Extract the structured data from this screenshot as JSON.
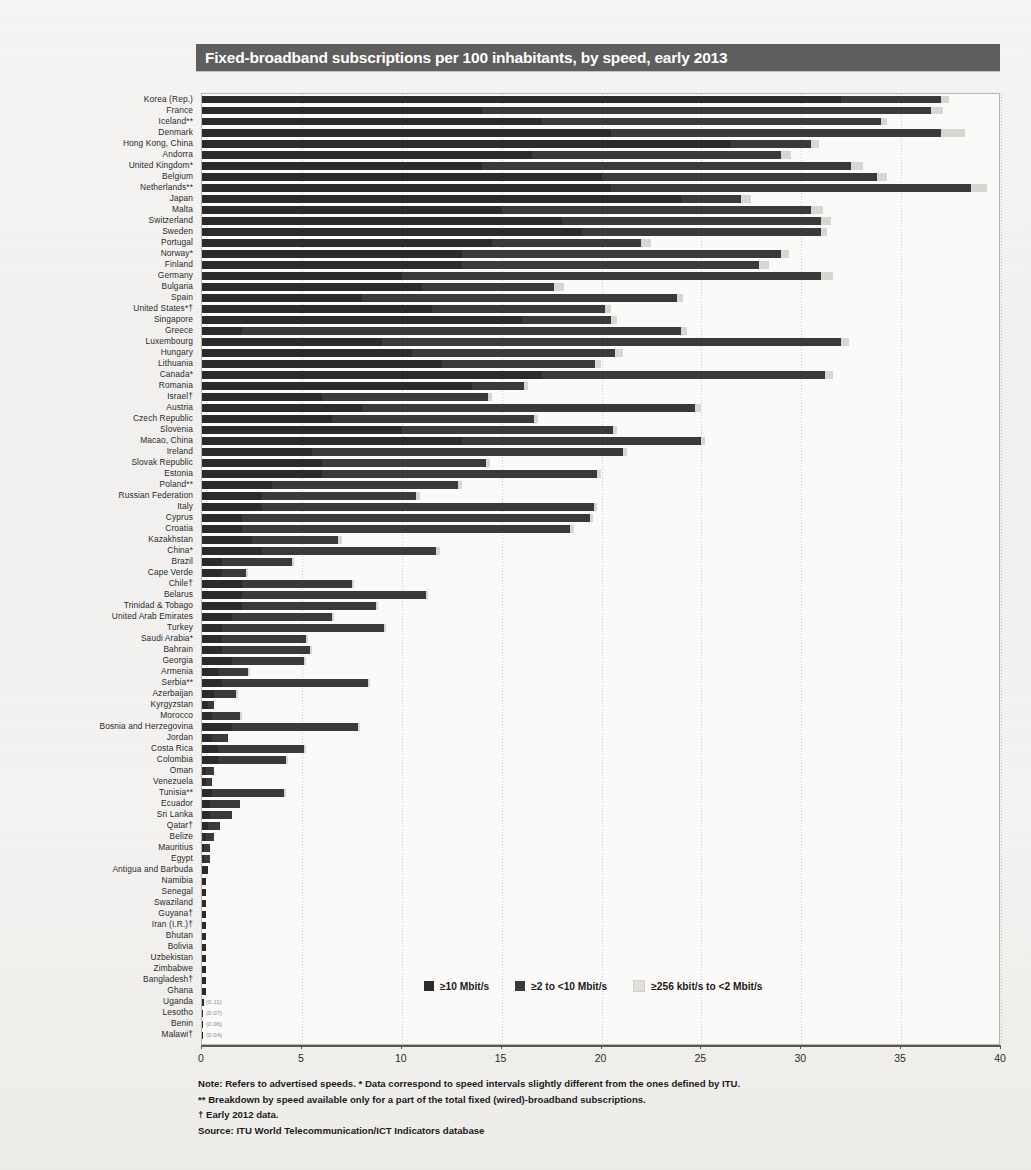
{
  "title": "Fixed-broadband subscriptions per 100 inhabitants, by speed, early 2013",
  "legend": {
    "items": [
      {
        "label": "≥10 Mbit/s",
        "key": "s10",
        "color": "#2b2b2b"
      },
      {
        "label": "≥2 to <10 Mbit/s",
        "key": "s2",
        "color": "#3a3a3a"
      },
      {
        "label": "≥256 kbit/s to <2 Mbit/s",
        "key": "s256",
        "color": "#e2e0dc"
      }
    ]
  },
  "notes": [
    "Note:  Refers to advertised speeds. * Data correspond to speed intervals slightly different from the ones defined by ITU.",
    "** Breakdown by speed available only for a part of the total fixed (wired)-broadband subscriptions.",
    "† Early 2012 data.",
    "Source: ITU World Telecommunication/ICT Indicators database"
  ],
  "chart_data": {
    "type": "bar",
    "orientation": "horizontal",
    "stacked": true,
    "title": "Fixed-broadband subscriptions per 100 inhabitants, by speed, early 2013",
    "xlabel": "",
    "ylabel": "",
    "xlim": [
      0,
      40
    ],
    "xticks": [
      0,
      5,
      10,
      15,
      20,
      25,
      30,
      35,
      40
    ],
    "xticklabels": [
      "0",
      "5",
      "10",
      "15",
      "20",
      "25",
      "30",
      "35",
      "40"
    ],
    "grid": "vertical-dotted",
    "legend_position": "bottom-center",
    "series": [
      {
        "name": "≥10 Mbit/s",
        "key": "s10",
        "color": "#2b2b2b"
      },
      {
        "name": "≥2 to <10 Mbit/s",
        "key": "s2",
        "color": "#3a3a3a"
      },
      {
        "name": "≥256 kbit/s to <2 Mbit/s",
        "key": "s256",
        "color": "#d8d6d2"
      }
    ],
    "categories": [
      "Korea (Rep.)",
      "France",
      "Iceland**",
      "Denmark",
      "Hong Kong, China",
      "Andorra",
      "United Kingdom*",
      "Belgium",
      "Netherlands**",
      "Japan",
      "Malta",
      "Switzerland",
      "Sweden",
      "Portugal",
      "Norway*",
      "Finland",
      "Germany",
      "Bulgaria",
      "Spain",
      "United States*†",
      "Singapore",
      "Greece",
      "Luxembourg",
      "Hungary",
      "Lithuania",
      "Canada*",
      "Romania",
      "Israel†",
      "Austria",
      "Czech Republic",
      "Slovenia",
      "Macao, China",
      "Ireland",
      "Slovak Republic",
      "Estonia",
      "Poland**",
      "Russian Federation",
      "Italy",
      "Cyprus",
      "Croatia",
      "Kazakhstan",
      "China*",
      "Brazil",
      "Cape Verde",
      "Chile†",
      "Belarus",
      "Trinidad & Tobago",
      "United Arab Emirates",
      "Turkey",
      "Saudi Arabia*",
      "Bahrain",
      "Georgia",
      "Armenia",
      "Serbia**",
      "Azerbaijan",
      "Kyrgyzstan",
      "Morocco",
      "Bosnia and Herzegovina",
      "Jordan",
      "Costa Rica",
      "Colombia",
      "Oman",
      "Venezuela",
      "Tunisia**",
      "Ecuador",
      "Sri Lanka",
      "Qatar†",
      "Belize",
      "Mauritius",
      "Egypt",
      "Antigua and Barbuda",
      "Namibia",
      "Senegal",
      "Swaziland",
      "Guyana†",
      "Iran (I.R.)†",
      "Bhutan",
      "Bolivia",
      "Uzbekistan",
      "Zimbabwe",
      "Bangladesh†",
      "Ghana",
      "Uganda",
      "Lesotho",
      "Benin",
      "Malawi†"
    ],
    "values": {
      "s10": [
        37.4,
        37.1,
        34.3,
        38.2,
        30.9,
        29.5,
        33.1,
        34.3,
        39.3,
        27.5,
        31.1,
        31.5,
        31.3,
        22.5,
        29.4,
        28.4,
        31.6,
        18.1,
        24.1,
        20.5,
        20.8,
        24.3,
        32.4,
        21.1,
        20.0,
        31.6,
        16.3,
        14.5,
        25.0,
        16.8,
        20.8,
        25.2,
        21.3,
        14.4,
        20.0,
        13.0,
        10.9,
        19.8,
        19.6,
        18.6,
        7.0,
        11.9,
        4.6,
        2.3,
        7.6,
        11.3,
        8.8,
        6.6,
        9.2,
        5.3,
        5.5,
        5.2,
        2.4,
        8.4,
        1.8,
        0.6,
        2.0,
        7.9,
        1.3,
        5.2,
        4.3,
        0.6,
        0.5,
        4.2,
        1.9,
        1.5,
        0.9,
        0.6,
        0.4,
        0.4,
        0.3,
        0.2,
        0.2,
        0.2,
        0.2,
        0.2,
        0.2,
        0.2,
        0.2,
        0.2,
        0.2,
        0.2,
        0.11,
        0.07,
        0.06,
        0.04
      ]
    },
    "value_annotations": {
      "Uganda": "(0.11)",
      "Lesotho": "(0.07)",
      "Benin": "(0.06)",
      "Malawi†": "(0.04)"
    },
    "segment_splits": {
      "Korea (Rep.)": [
        32.0,
        5.0,
        0.4
      ],
      "France": [
        14.0,
        22.5,
        0.6
      ],
      "Iceland**": [
        17.0,
        17.0,
        0.3
      ],
      "Denmark": [
        20.5,
        16.5,
        1.2
      ],
      "Hong Kong, China": [
        26.5,
        4.0,
        0.4
      ],
      "Andorra": [
        16.5,
        12.5,
        0.5
      ],
      "United Kingdom*": [
        14.0,
        18.5,
        0.6
      ],
      "Belgium": [
        20.0,
        13.8,
        0.5
      ],
      "Netherlands**": [
        20.5,
        18.0,
        0.8
      ],
      "Japan": [
        24.0,
        3.0,
        0.5
      ],
      "Malta": [
        15.0,
        15.5,
        0.6
      ],
      "Switzerland": [
        18.0,
        13.0,
        0.5
      ],
      "Sweden": [
        19.0,
        12.0,
        0.3
      ],
      "Portugal": [
        14.5,
        7.5,
        0.5
      ],
      "Norway*": [
        13.0,
        16.0,
        0.4
      ],
      "Finland": [
        13.0,
        14.9,
        0.5
      ],
      "Germany": [
        10.0,
        21.0,
        0.6
      ],
      "Bulgaria": [
        11.0,
        6.6,
        0.5
      ],
      "Spain": [
        8.0,
        15.8,
        0.3
      ],
      "United States*†": [
        11.5,
        8.7,
        0.3
      ],
      "Singapore": [
        16.0,
        4.5,
        0.3
      ],
      "Greece": [
        2.0,
        22.0,
        0.3
      ],
      "Luxembourg": [
        9.0,
        23.0,
        0.4
      ],
      "Hungary": [
        10.5,
        10.2,
        0.4
      ],
      "Lithuania": [
        12.0,
        7.7,
        0.3
      ],
      "Canada*": [
        17.0,
        14.2,
        0.4
      ],
      "Romania": [
        13.5,
        2.6,
        0.2
      ],
      "Israel†": [
        6.0,
        8.3,
        0.2
      ],
      "Austria": [
        8.0,
        16.7,
        0.3
      ],
      "Czech Republic": [
        6.5,
        10.1,
        0.2
      ],
      "Slovenia": [
        10.0,
        10.6,
        0.2
      ],
      "Macao, China": [
        13.0,
        12.0,
        0.2
      ],
      "Ireland": [
        5.5,
        15.6,
        0.2
      ],
      "Slovak Republic": [
        6.0,
        8.2,
        0.2
      ],
      "Estonia": [
        6.0,
        13.8,
        0.2
      ],
      "Poland**": [
        3.5,
        9.3,
        0.2
      ],
      "Russian Federation": [
        3.0,
        7.7,
        0.2
      ],
      "Italy": [
        3.0,
        16.6,
        0.2
      ],
      "Cyprus": [
        2.0,
        17.4,
        0.2
      ],
      "Croatia": [
        2.0,
        16.4,
        0.2
      ],
      "Kazakhstan": [
        2.5,
        4.3,
        0.2
      ],
      "China*": [
        3.0,
        8.7,
        0.2
      ],
      "Brazil": [
        1.0,
        3.5,
        0.1
      ],
      "Cape Verde": [
        1.0,
        1.2,
        0.1
      ],
      "Chile†": [
        2.0,
        5.5,
        0.1
      ],
      "Belarus": [
        2.0,
        9.2,
        0.1
      ],
      "Trinidad & Tobago": [
        2.0,
        6.7,
        0.1
      ],
      "United Arab Emirates": [
        1.5,
        5.0,
        0.1
      ],
      "Turkey": [
        1.0,
        8.1,
        0.1
      ],
      "Saudi Arabia*": [
        1.0,
        4.2,
        0.1
      ],
      "Bahrain": [
        1.0,
        4.4,
        0.1
      ],
      "Georgia": [
        1.5,
        3.6,
        0.1
      ],
      "Armenia": [
        0.8,
        1.5,
        0.1
      ],
      "Serbia**": [
        1.0,
        7.3,
        0.1
      ],
      "Azerbaijan": [
        0.6,
        1.1,
        0.1
      ],
      "Kyrgyzstan": [
        0.3,
        0.3,
        0.0
      ],
      "Morocco": [
        0.5,
        1.4,
        0.1
      ],
      "Bosnia and Herzegovina": [
        1.5,
        6.3,
        0.1
      ],
      "Jordan": [
        0.5,
        0.8,
        0.0
      ],
      "Costa Rica": [
        0.8,
        4.3,
        0.1
      ],
      "Colombia": [
        0.8,
        3.4,
        0.1
      ],
      "Oman": [
        0.2,
        0.4,
        0.0
      ],
      "Venezuela": [
        0.2,
        0.3,
        0.0
      ],
      "Tunisia**": [
        0.5,
        3.6,
        0.1
      ],
      "Ecuador": [
        0.4,
        1.5,
        0.0
      ],
      "Sri Lanka": [
        0.4,
        1.1,
        0.0
      ],
      "Qatar†": [
        0.3,
        0.6,
        0.0
      ],
      "Belize": [
        0.2,
        0.4,
        0.0
      ],
      "Mauritius": [
        0.1,
        0.3,
        0.0
      ],
      "Egypt": [
        0.1,
        0.3,
        0.0
      ]
    }
  }
}
